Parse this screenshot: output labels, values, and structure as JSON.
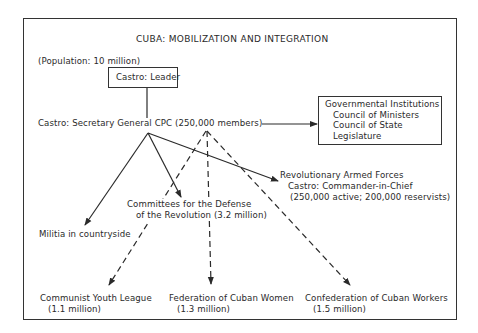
{
  "title": "CUBA:  MOBILIZATION AND INTEGRATION",
  "population": "(Population:  10 million)",
  "leader": "Castro:  Leader",
  "party": "Castro:  Secretary General CPC (250,000 members)",
  "government": {
    "heading": "Governmental Institutions",
    "items": [
      "Council of Ministers",
      "Council of State",
      "Legislature"
    ]
  },
  "armed_forces": {
    "heading": "Revolutionary Armed Forces",
    "line2": "Castro:  Commander-in-Chief",
    "line3": "(250,000 active;  200,000 reservists)"
  },
  "committees": {
    "line1": "Committees for the Defense",
    "line2": "of the Revolution (3.2 million)"
  },
  "militia": "Militia in countryside",
  "youth": {
    "name": "Communist Youth League",
    "size": "(1.1 million)"
  },
  "women": {
    "name": "Federation of Cuban Women",
    "size": "(1.3 million)"
  },
  "workers": {
    "name": "Confederation of Cuban Workers",
    "size": "(1.5 million)"
  },
  "legend": {
    "solid": "direct control",
    "dashed": "party influence"
  },
  "colors": {
    "ink": "#2a2a2a",
    "paper": "#ffffff"
  }
}
